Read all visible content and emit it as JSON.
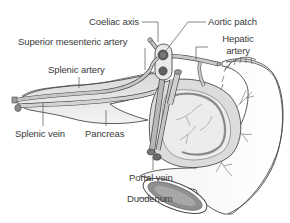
{
  "diagram": {
    "type": "anatomical-illustration",
    "labels": {
      "coeliac_axis": "Coeliac axis",
      "aortic_patch": "Aortic patch",
      "superior_mesenteric_artery": "Superior mesenteric artery",
      "hepatic_artery_line1": "Hepatic",
      "hepatic_artery_line2": "artery",
      "splenic_artery": "Splenic artery",
      "splenic_vein": "Splenic vein",
      "pancreas": "Pancreas",
      "portal_vein": "Portal vein",
      "duodenum": "Duodenum"
    },
    "colors": {
      "background": "#ffffff",
      "outline": "#4a4a4a",
      "tissue_fill": "#e6e6e6",
      "tissue_light": "#f2f2f2",
      "vessel_fill": "#bdbdbd",
      "vessel_dark": "#8c8c8c",
      "lumen": "#9a9a9a",
      "label_text": "#3a3a3a",
      "leader_line": "#555555"
    }
  }
}
